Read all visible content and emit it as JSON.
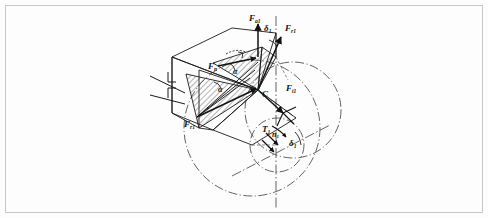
{
  "figure": {
    "kind": "engineering-line-drawing",
    "frame": {
      "border_color": "#c8c8c8",
      "background_color": "#fdfdfd",
      "width": 488,
      "height": 218
    },
    "ink_color": "#1a1a1a",
    "hatch_color": "#2a2a2a",
    "centerline_color": "#3a3a3a"
  },
  "labels": [
    {
      "id": "F-a1-top",
      "base": "F",
      "sub": "a1",
      "x": 249,
      "y": 14,
      "size": "sz9"
    },
    {
      "id": "F-r1-right",
      "base": "F",
      "sub": "r1",
      "x": 285,
      "y": 24,
      "size": "sz9"
    },
    {
      "id": "F-n-left",
      "base": "F",
      "sub": "n",
      "x": 208,
      "y": 62,
      "size": "sz9"
    },
    {
      "id": "F-t1-right",
      "base": "F",
      "sub": "t1",
      "x": 286,
      "y": 84,
      "size": "sz9"
    },
    {
      "id": "F-r1-lower",
      "base": "F",
      "sub": "r1",
      "x": 184,
      "y": 120,
      "size": "sz9"
    },
    {
      "id": "T-1",
      "base": "T",
      "sub": "1",
      "x": 262,
      "y": 125,
      "size": "sz9"
    },
    {
      "id": "n-1",
      "base": "n",
      "sub": "1",
      "x": 272,
      "y": 131,
      "size": "sz8"
    },
    {
      "id": "point-C",
      "base": "C",
      "sub": "",
      "x": 262,
      "y": 90,
      "size": "sz9"
    },
    {
      "id": "delta-top",
      "base": "δ",
      "sub": "1",
      "x": 264,
      "y": 24,
      "size": "sz9"
    },
    {
      "id": "delta-lower",
      "base": "δ",
      "sub": "1",
      "x": 289,
      "y": 139,
      "size": "sz9"
    },
    {
      "id": "alpha-upper",
      "base": "α",
      "sub": "",
      "x": 233,
      "y": 68,
      "size": "sz8"
    },
    {
      "id": "alpha-lower",
      "base": "α",
      "sub": "",
      "x": 218,
      "y": 86,
      "size": "sz8"
    }
  ],
  "annotations": {
    "force_names": [
      "F a1",
      "F r1",
      "F t1",
      "F n",
      "T 1",
      "n 1"
    ],
    "angle_names": [
      "delta 1",
      "alpha"
    ],
    "point_names": [
      "C"
    ],
    "section_symbol": "shaft-break-mark"
  }
}
